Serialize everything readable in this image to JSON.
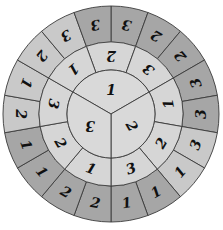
{
  "geometry": {
    "cx": 111,
    "cy": 114,
    "r_inner": 44,
    "r_middle": 72,
    "r_outer": 108
  },
  "colors": {
    "inner": "#d9d9d9",
    "middle": "#d6d6d6",
    "outer_light": "#c9c9c9",
    "outer_dark": "#a6a6a6",
    "stroke": "#3a3a3a",
    "text": "#111111"
  },
  "inner_ring": {
    "start_angle": -60,
    "segments": [
      {
        "label": "1",
        "shade": "inner"
      },
      {
        "label": "2",
        "shade": "inner"
      },
      {
        "label": "3",
        "shade": "inner"
      }
    ]
  },
  "middle_ring": {
    "start_angle": -20,
    "segments": [
      {
        "label": "2",
        "shade": "middle"
      },
      {
        "label": "3",
        "shade": "middle"
      },
      {
        "label": "1",
        "shade": "middle"
      },
      {
        "label": "2",
        "shade": "middle"
      },
      {
        "label": "3",
        "shade": "middle"
      },
      {
        "label": "1",
        "shade": "middle"
      },
      {
        "label": "2",
        "shade": "middle"
      },
      {
        "label": "3",
        "shade": "middle"
      },
      {
        "label": "1",
        "shade": "middle"
      }
    ]
  },
  "outer_ring": {
    "start_angle": 0,
    "segments": [
      {
        "label": "3",
        "shade": "outer_dark"
      },
      {
        "label": "2",
        "shade": "outer_dark"
      },
      {
        "label": "2",
        "shade": "outer_dark"
      },
      {
        "label": "3",
        "shade": "outer_dark"
      },
      {
        "label": "3",
        "shade": "outer_dark"
      },
      {
        "label": "3",
        "shade": "outer_light"
      },
      {
        "label": "1",
        "shade": "outer_light"
      },
      {
        "label": "1",
        "shade": "outer_dark"
      },
      {
        "label": "1",
        "shade": "outer_dark"
      },
      {
        "label": "2",
        "shade": "outer_dark"
      },
      {
        "label": "2",
        "shade": "outer_dark"
      },
      {
        "label": "1",
        "shade": "outer_dark"
      },
      {
        "label": "1",
        "shade": "outer_dark"
      },
      {
        "label": "2",
        "shade": "outer_light"
      },
      {
        "label": "1",
        "shade": "outer_light"
      },
      {
        "label": "2",
        "shade": "outer_light"
      },
      {
        "label": "3",
        "shade": "outer_light"
      },
      {
        "label": "3",
        "shade": "outer_dark"
      }
    ]
  }
}
